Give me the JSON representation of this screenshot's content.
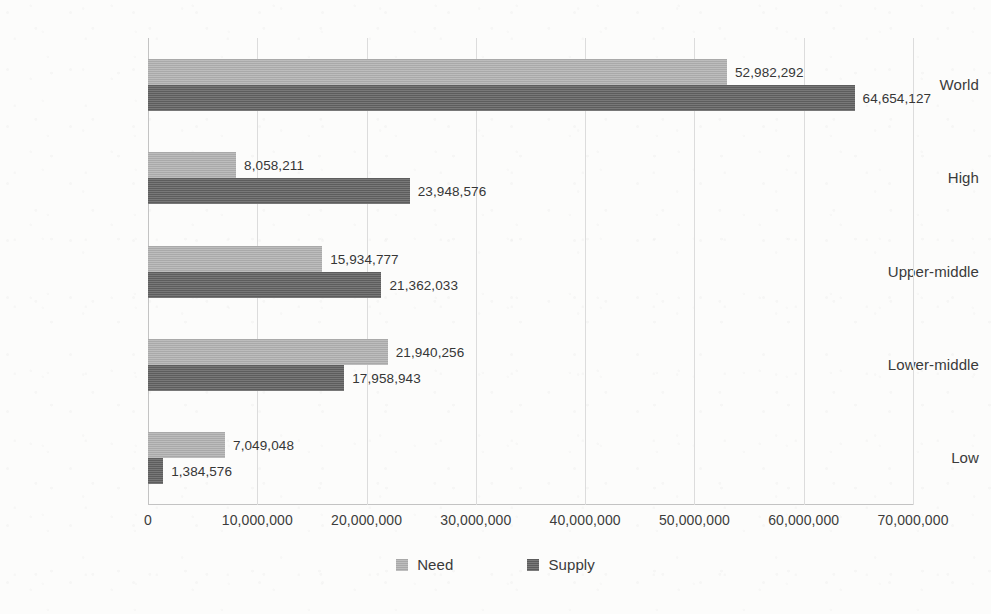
{
  "chart_data": {
    "type": "bar",
    "orientation": "horizontal",
    "title": "",
    "subtitle": "",
    "xlabel": "",
    "ylabel": "",
    "categories": [
      "World",
      "High",
      "Upper-middle",
      "Lower-middle",
      "Low"
    ],
    "series": [
      {
        "name": "Need",
        "color": "#b2b2b2",
        "values": [
          52982292,
          8058211,
          15934777,
          21940256,
          7049048
        ],
        "value_labels": [
          "52,982,292",
          "8,058,211",
          "15,934,777",
          "21,940,256",
          "7,049,048"
        ]
      },
      {
        "name": "Supply",
        "color": "#626262",
        "values": [
          64654127,
          23948576,
          21362033,
          17958943,
          1384576
        ],
        "value_labels": [
          "64,654,127",
          "23,948,576",
          "21,362,033",
          "17,958,943",
          "1,384,576"
        ]
      }
    ],
    "xlim": [
      0,
      70000000
    ],
    "xticks": [
      0,
      10000000,
      20000000,
      30000000,
      40000000,
      50000000,
      60000000,
      70000000
    ],
    "xtick_labels": [
      "0",
      "10,000,000",
      "20,000,000",
      "30,000,000",
      "40,000,000",
      "50,000,000",
      "60,000,000",
      "70,000,000"
    ],
    "grid": "vertical",
    "data_labels": true,
    "legend": {
      "position": "bottom",
      "entries": [
        {
          "label": "Need",
          "color": "#b2b2b2"
        },
        {
          "label": "Supply",
          "color": "#626262"
        }
      ]
    }
  }
}
